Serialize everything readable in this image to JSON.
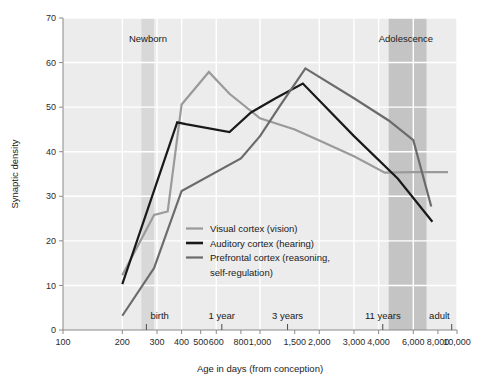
{
  "figure": {
    "title": "",
    "background": "#ffffff",
    "plot_background": "#ececec"
  },
  "chart_data": {
    "type": "line",
    "title": "",
    "subtitle": "",
    "xlabel": "Age in days (from conception)",
    "ylabel": "Synaptic density",
    "xscale": "log",
    "xlim": [
      100,
      10000
    ],
    "ylim": [
      0,
      70
    ],
    "grid": true,
    "grid_color": "#ffffff",
    "legend_position": "center-lower",
    "xticks": [
      100,
      200,
      300,
      400,
      500,
      600,
      800,
      1000,
      1500,
      2000,
      3000,
      4000,
      6000,
      8000,
      10000
    ],
    "xticklabels": [
      "100",
      "200",
      "300",
      "400",
      "500",
      "600",
      "800",
      "1,000",
      "1,500",
      "2,000",
      "3,000",
      "4,000",
      "6,000",
      "8,000",
      "10,000"
    ],
    "yticks": [
      0,
      10,
      20,
      30,
      40,
      50,
      60,
      70
    ],
    "yticklabels": [
      "0",
      "10",
      "20",
      "30",
      "40",
      "50",
      "60",
      "70"
    ],
    "series": [
      {
        "name": "Visual cortex (vision)",
        "color": "#9a9a9a",
        "width": 2.2,
        "x": [
          200,
          290,
          340,
          400,
          550,
          700,
          1000,
          1500,
          2000,
          3000,
          4300,
          6000,
          9000
        ],
        "y": [
          12.3,
          25.8,
          26.6,
          50.6,
          57.9,
          53.0,
          47.5,
          45.0,
          42.5,
          39.0,
          35.3,
          35.4,
          35.4
        ]
      },
      {
        "name": "Auditory cortex (hearing)",
        "color": "#1a1a1a",
        "width": 2.2,
        "x": [
          200,
          380,
          420,
          700,
          900,
          1200,
          1650,
          3000,
          5000,
          7500
        ],
        "y": [
          10.3,
          46.6,
          46.2,
          44.4,
          48.8,
          52.0,
          55.3,
          43.5,
          34.0,
          24.3
        ]
      },
      {
        "name": "Prefrontal cortex (reasoning, self-regulation)",
        "color": "#6b6b6b",
        "width": 2.2,
        "x": [
          200,
          290,
          400,
          800,
          1000,
          1250,
          1700,
          3000,
          4500,
          6000,
          7400
        ],
        "y": [
          3.2,
          13.9,
          31.2,
          38.5,
          43.5,
          50.0,
          58.7,
          52.0,
          47.0,
          42.6,
          27.7
        ]
      }
    ],
    "bands": [
      {
        "label": "Newborn",
        "x0": 250,
        "x1": 290,
        "color": "#d8d8d8"
      },
      {
        "label": "Adolescence",
        "x0": 4500,
        "x1": 7000,
        "color": "#c4c4c4"
      }
    ],
    "top_annotations": [
      {
        "text": "Newborn",
        "x": 270
      },
      {
        "text": "Adolescence",
        "x": 5500
      }
    ],
    "bottom_annotations": [
      {
        "text": "birth",
        "x": 265
      },
      {
        "text": "1 year",
        "x": 640
      },
      {
        "text": "3 years",
        "x": 1380
      },
      {
        "text": "11 years",
        "x": 4200
      },
      {
        "text": "adult",
        "x": 9400
      }
    ],
    "bottom_annotation_ticks": [
      265,
      640,
      1380,
      4200,
      9400
    ]
  },
  "legend": {
    "entries": [
      {
        "label": "Visual cortex (vision)",
        "color": "#9a9a9a"
      },
      {
        "label": "Auditory cortex (hearing)",
        "color": "#1a1a1a"
      },
      {
        "label": "Prefrontal cortex (reasoning,",
        "color": "#6b6b6b"
      },
      {
        "label": "self-regulation)",
        "color": ""
      }
    ]
  }
}
